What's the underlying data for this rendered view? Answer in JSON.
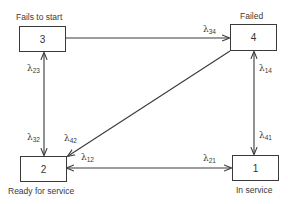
{
  "diagram": {
    "type": "state-transition",
    "line_color": "#3a3a3a",
    "states": [
      {
        "id": "3",
        "number": "3",
        "label": "Fails to start"
      },
      {
        "id": "4",
        "number": "4",
        "label": "Failed"
      },
      {
        "id": "2",
        "number": "2",
        "label": "Ready for service"
      },
      {
        "id": "1",
        "number": "1",
        "label": "In service"
      }
    ],
    "transitions": [
      {
        "from": "3",
        "to": "4",
        "symbol": "λ",
        "sub": "34"
      },
      {
        "from": "2",
        "to": "3",
        "symbol": "λ",
        "sub": "23"
      },
      {
        "from": "3",
        "to": "2",
        "symbol": "λ",
        "sub": "32"
      },
      {
        "from": "4",
        "to": "2",
        "symbol": "λ",
        "sub": "42"
      },
      {
        "from": "1",
        "to": "4",
        "symbol": "λ",
        "sub": "14"
      },
      {
        "from": "4",
        "to": "1",
        "symbol": "λ",
        "sub": "41"
      },
      {
        "from": "1",
        "to": "2",
        "symbol": "λ",
        "sub": "12"
      },
      {
        "from": "2",
        "to": "1",
        "symbol": "λ",
        "sub": "21"
      }
    ]
  }
}
